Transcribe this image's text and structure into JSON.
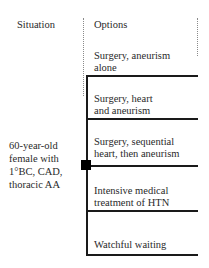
{
  "headers": {
    "situation": "Situation",
    "options": "Options"
  },
  "situation": {
    "lines": [
      "60-year-old",
      "female with",
      "1°BC, CAD,",
      "thoracic AA"
    ]
  },
  "options": [
    {
      "line1": "Surgery, aneurism",
      "line2": "alone"
    },
    {
      "line1": "Surgery, heart",
      "line2": "and aneurism"
    },
    {
      "line1": "Surgery, sequential",
      "line2": "heart, then aneurism"
    },
    {
      "line1": "Intensive medical",
      "line2": "treatment of HTN"
    },
    {
      "line1": "Watchful waiting",
      "line2": ""
    }
  ],
  "colors": {
    "line": "#1a1a1a",
    "node": "#000000",
    "dotted": "#8a8a8a",
    "text": "#2a2a2a"
  },
  "node": {
    "type": "decision-square"
  }
}
